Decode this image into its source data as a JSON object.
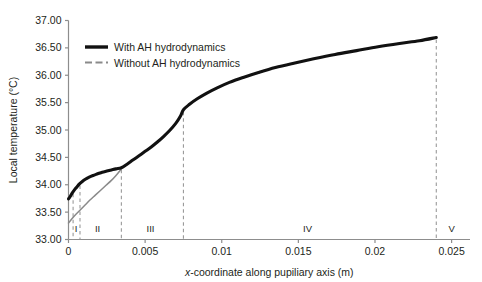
{
  "chart_data": {
    "type": "line",
    "title": "",
    "xlabel": "x-coordinate along pupiliary axis (m)",
    "xlabel_italic_prefix": "x",
    "xlabel_rest": "-coordinate along pupiliary axis (m)",
    "ylabel": "Local temperature (°C)",
    "xlim": [
      0,
      0.0262
    ],
    "ylim": [
      33.0,
      37.0
    ],
    "xticks": [
      0,
      0.005,
      0.01,
      0.015,
      0.02,
      0.025
    ],
    "xtick_labels": [
      "0",
      "0.005",
      "0.01",
      "0.015",
      "0.02",
      "0.025"
    ],
    "yticks": [
      33.0,
      33.5,
      34.0,
      34.5,
      35.0,
      35.5,
      36.0,
      36.5,
      37.0
    ],
    "ytick_labels": [
      "33.00",
      "33.50",
      "34.00",
      "34.50",
      "35.00",
      "35.50",
      "36.00",
      "36.50",
      "37.00"
    ],
    "grid": false,
    "legend_position": "upper-left-inside",
    "series": [
      {
        "name": "With AH hydrodynamics",
        "color": "#111111",
        "style": "solid",
        "width": 3.1,
        "points": [
          [
            0.0,
            33.74
          ],
          [
            0.00012,
            33.79
          ],
          [
            0.00025,
            33.85
          ],
          [
            0.0004,
            33.91
          ],
          [
            0.00055,
            33.96
          ],
          [
            0.0007,
            34.01
          ],
          [
            0.0009,
            34.06
          ],
          [
            0.0011,
            34.1
          ],
          [
            0.00135,
            34.14
          ],
          [
            0.0016,
            34.17
          ],
          [
            0.0019,
            34.2
          ],
          [
            0.0022,
            34.23
          ],
          [
            0.0025,
            34.25
          ],
          [
            0.0028,
            34.27
          ],
          [
            0.0031,
            34.29
          ],
          [
            0.00345,
            34.31
          ],
          [
            0.0038,
            34.37
          ],
          [
            0.0042,
            34.45
          ],
          [
            0.0046,
            34.53
          ],
          [
            0.005,
            34.61
          ],
          [
            0.0054,
            34.69
          ],
          [
            0.0058,
            34.78
          ],
          [
            0.0062,
            34.88
          ],
          [
            0.0066,
            34.99
          ],
          [
            0.007,
            35.12
          ],
          [
            0.0073,
            35.25
          ],
          [
            0.0075,
            35.37
          ],
          [
            0.0079,
            35.47
          ],
          [
            0.0084,
            35.57
          ],
          [
            0.009,
            35.67
          ],
          [
            0.0097,
            35.77
          ],
          [
            0.0105,
            35.87
          ],
          [
            0.0114,
            35.96
          ],
          [
            0.0124,
            36.05
          ],
          [
            0.0135,
            36.14
          ],
          [
            0.0147,
            36.22
          ],
          [
            0.016,
            36.3
          ],
          [
            0.0174,
            36.38
          ],
          [
            0.0188,
            36.45
          ],
          [
            0.0202,
            36.52
          ],
          [
            0.0216,
            36.58
          ],
          [
            0.0229,
            36.63
          ],
          [
            0.024,
            36.69
          ]
        ]
      },
      {
        "name": "Without AH hydrodynamics",
        "color": "#8a8a8a",
        "style": "solid",
        "width": 1.5,
        "points": [
          [
            0.0,
            33.3
          ],
          [
            0.00035,
            33.42
          ],
          [
            0.0007,
            33.52
          ],
          [
            0.00105,
            33.62
          ],
          [
            0.0014,
            33.72
          ],
          [
            0.00175,
            33.81
          ],
          [
            0.0021,
            33.9
          ],
          [
            0.00245,
            33.99
          ],
          [
            0.0028,
            34.08
          ],
          [
            0.0031,
            34.17
          ],
          [
            0.00345,
            34.29
          ]
        ]
      }
    ],
    "region_dividers": [
      {
        "x": 0.0003,
        "label_after": "II"
      },
      {
        "x": 0.00075,
        "label_after": "II"
      },
      {
        "x": 0.00345,
        "label_after": "III"
      },
      {
        "x": 0.0075,
        "label_after": "IV"
      },
      {
        "x": 0.024,
        "label_after": "V"
      }
    ],
    "region_labels": [
      {
        "text": "I",
        "x": 0.0005
      },
      {
        "text": "II",
        "x": 0.0019
      },
      {
        "text": "III",
        "x": 0.00535
      },
      {
        "text": "IV",
        "x": 0.0156
      },
      {
        "text": "V",
        "x": 0.025
      }
    ],
    "divider_color": "#9a9a9a",
    "axis_color": "#8d8d8d",
    "annotations": []
  },
  "legend": {
    "items": [
      {
        "label": "With AH hydrodynamics",
        "swatch": "thick-black-line"
      },
      {
        "label": "Without AH hydrodynamics",
        "swatch": "thin-gray-dashed-line"
      }
    ]
  }
}
